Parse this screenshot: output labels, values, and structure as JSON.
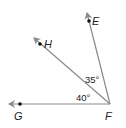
{
  "diagram": {
    "vertex": {
      "label": "F",
      "x": 110,
      "y": 104
    },
    "rays": [
      {
        "name": "FG",
        "end_x": 8,
        "end_y": 104,
        "point": {
          "label": "G",
          "x": 20,
          "y": 104
        }
      },
      {
        "name": "FH",
        "end_x": 33,
        "end_y": 37,
        "point": {
          "label": "H",
          "x": 40,
          "y": 44
        }
      },
      {
        "name": "FE",
        "end_x": 87,
        "end_y": 12,
        "point": {
          "label": "E",
          "x": 89,
          "y": 21
        }
      }
    ],
    "angles": [
      {
        "between": "HFE",
        "label": "35°"
      },
      {
        "between": "GFH",
        "label": "40°"
      }
    ],
    "colors": {
      "ray": "#8a8a8a",
      "point": "#111111",
      "text": "#222222"
    }
  }
}
